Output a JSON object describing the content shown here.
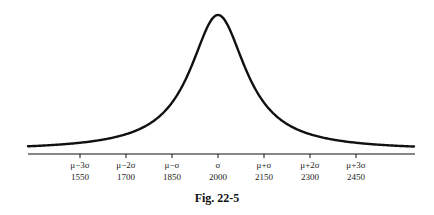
{
  "caption": "Fig. 22-5",
  "chart_data": {
    "type": "line",
    "title": "",
    "caption": "Fig. 22-5",
    "xlabel": "",
    "ylabel": "",
    "grid": false,
    "legend": null,
    "x_ticks": [
      {
        "symbol": "μ−3σ",
        "value": 1550
      },
      {
        "symbol": "μ−2σ",
        "value": 1700
      },
      {
        "symbol": "μ−σ",
        "value": 1850
      },
      {
        "symbol": "σ",
        "value": 2000
      },
      {
        "symbol": "μ+σ",
        "value": 2150
      },
      {
        "symbol": "μ+2σ",
        "value": 2300
      },
      {
        "symbol": "μ+3σ",
        "value": 2450
      }
    ],
    "xlim": [
      1380,
      2640
    ],
    "center": 2000,
    "sigma": 150,
    "line_color": "#111111",
    "axis_color": "#111111"
  }
}
